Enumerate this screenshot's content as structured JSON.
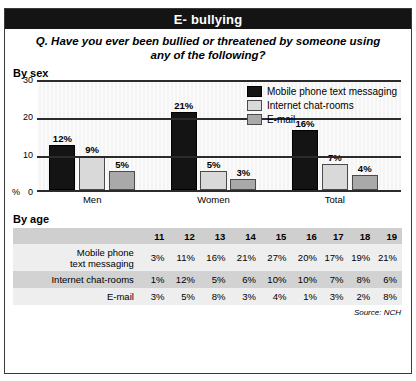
{
  "banner": {
    "title": "E- bullying"
  },
  "question": "Q. Have you ever been bullied or threatened by someone using any of the following?",
  "sections": {
    "by_sex": "By sex",
    "by_age": "By age"
  },
  "source": "Source: NCH",
  "chart_data": {
    "type": "bar",
    "title": "By sex",
    "xlabel": "",
    "ylabel": "%",
    "ylim": [
      0,
      30
    ],
    "yticks": [
      "0",
      "10",
      "20",
      "30"
    ],
    "grid": true,
    "legend_position": "top-right",
    "categories": [
      "Men",
      "Women",
      "Total"
    ],
    "series": [
      {
        "name": "Mobile phone text messaging",
        "color": "#141414",
        "values": [
          12,
          21,
          16
        ],
        "labels": [
          "12%",
          "21%",
          "16%"
        ]
      },
      {
        "name": "Internet chat-rooms",
        "color": "#d9d9d9",
        "values": [
          9,
          5,
          7
        ],
        "labels": [
          "9%",
          "5%",
          "7%"
        ]
      },
      {
        "name": "E-mail",
        "color": "#a9a9a9",
        "values": [
          5,
          3,
          4
        ],
        "labels": [
          "5%",
          "3%",
          "4%"
        ]
      }
    ]
  },
  "age_table": {
    "corner": "",
    "columns": [
      "11",
      "12",
      "13",
      "14",
      "15",
      "16",
      "17",
      "18",
      "19"
    ],
    "rows": [
      {
        "label_line1": "Mobile phone",
        "label_line2": "text messaging",
        "values": [
          "3%",
          "11%",
          "16%",
          "21%",
          "27%",
          "20%",
          "17%",
          "19%",
          "21%"
        ]
      },
      {
        "label_line1": "Internet chat-rooms",
        "label_line2": "",
        "values": [
          "1%",
          "12%",
          "5%",
          "6%",
          "10%",
          "10%",
          "7%",
          "8%",
          "6%"
        ]
      },
      {
        "label_line1": "E-mail",
        "label_line2": "",
        "values": [
          "3%",
          "5%",
          "8%",
          "3%",
          "4%",
          "1%",
          "3%",
          "2%",
          "8%"
        ]
      }
    ]
  }
}
